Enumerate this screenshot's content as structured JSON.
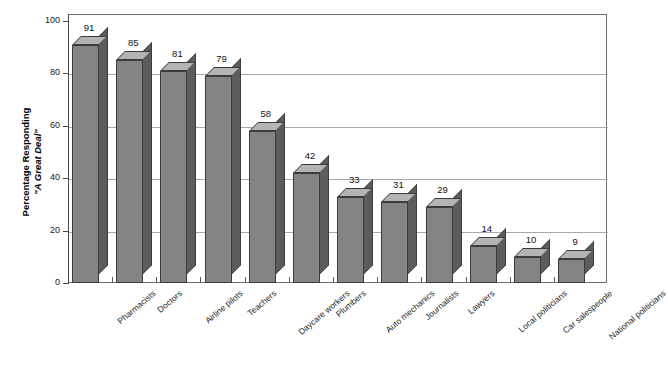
{
  "chart_data": {
    "type": "bar",
    "title": "",
    "subtitle": "",
    "xlabel": "",
    "ylabel": "Percentage Responding \"A Great Deal\"",
    "ylabel_line1": "Percentage Responding",
    "ylabel_line2": "\"A Great Deal\"",
    "ylim": [
      0,
      100
    ],
    "yticks": [
      0,
      20,
      40,
      60,
      80,
      100
    ],
    "grid": true,
    "legend": false,
    "style": "3d-bar",
    "bar_color": "#848484",
    "bar_top_color": "#b4b4b4",
    "bar_side_color": "#5c5c5c",
    "bar_edge_color": "#3c3c3c",
    "gridline_color": "#a8a8a8",
    "axis_color": "#4a4a4a",
    "background_color": "#ffffff",
    "categories": [
      "Pharmacists",
      "Doctors",
      "Airline pilots",
      "Teachers",
      "Daycare workers",
      "Plumbers",
      "Auto mechanics",
      "Journalists",
      "Lawyers",
      "Local politicians",
      "Car salespeople",
      "National politicians"
    ],
    "values": [
      91,
      85,
      81,
      79,
      58,
      42,
      33,
      31,
      29,
      14,
      10,
      9
    ],
    "data_labels": [
      "91",
      "85",
      "81",
      "79",
      "58",
      "42",
      "33",
      "31",
      "29",
      "14",
      "10",
      "9"
    ],
    "ytick_labels": [
      "0",
      "20",
      "40",
      "60",
      "80",
      "100"
    ]
  }
}
